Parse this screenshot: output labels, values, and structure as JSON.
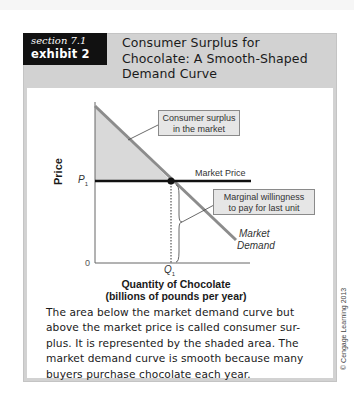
{
  "exhibit": {
    "section_label": "section 7.1",
    "exhibit_label": "exhibit 2",
    "title_lines": [
      "Consumer Surplus for",
      "Chocolate: A Smooth-Shaped",
      "Demand Curve"
    ]
  },
  "diagram": {
    "y_axis_label": "Price",
    "x_axis_label_line1": "Quantity of Chocolate",
    "x_axis_label_line2": "(billions of pounds per year)",
    "origin_label": "0",
    "price_label": "P",
    "price_subscript": "1",
    "quantity_label": "Q",
    "quantity_subscript": "1",
    "market_price_label": "Market Price",
    "consumer_surplus_box": [
      "Consumer surplus",
      "in the market"
    ],
    "marginal_box": [
      "Marginal willingness",
      "to pay for last unit"
    ],
    "demand_label": [
      "Market",
      "Demand"
    ],
    "colors": {
      "surplus_fill": "#d9d9d9",
      "demand_line": "#8c8c8c",
      "price_line": "#111111"
    }
  },
  "caption": {
    "lines": [
      "The area below the market demand curve but",
      "above the market price is called consumer sur-",
      "plus. It is represented by the shaded area. The",
      "market demand curve is smooth because many",
      "buyers purchase chocolate each year."
    ]
  },
  "copyright": "© Cengage Learning 2013"
}
